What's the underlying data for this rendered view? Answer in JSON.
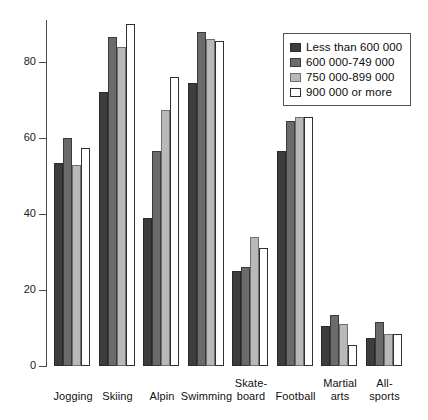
{
  "chart_data": {
    "type": "bar",
    "title": "",
    "xlabel": "",
    "ylabel": "",
    "ylim": [
      0,
      92
    ],
    "yticks": [
      0,
      20,
      40,
      60,
      80
    ],
    "ytick_labels": [
      "0",
      "20",
      "40",
      "60",
      "80"
    ],
    "grid": false,
    "legend_position": "top-right",
    "categories": [
      "Jogging",
      "Skiing",
      "Alpin",
      "Swimming",
      "Skate-\nboard",
      "Football",
      "Martial\narts",
      "All-sports"
    ],
    "series": [
      {
        "name": "Less than 600 000",
        "color": "#3d3d3d",
        "values": [
          53.5,
          72,
          39,
          74.5,
          25,
          56.5,
          10.5,
          7.5
        ]
      },
      {
        "name": "600 000-749 000",
        "color": "#6b6b6b",
        "values": [
          60,
          86.5,
          56.5,
          88,
          26,
          64.5,
          13.5,
          11.5
        ]
      },
      {
        "name": "750 000-899 000",
        "color": "#b9b9b9",
        "values": [
          53,
          84,
          67.5,
          86,
          34,
          65.5,
          11,
          8.5
        ]
      },
      {
        "name": "900 000 or more",
        "color": "#ffffff",
        "values": [
          57.5,
          90,
          76,
          85.5,
          31,
          65.5,
          5.5,
          8.5
        ]
      }
    ]
  },
  "legend": {
    "items": [
      {
        "label": "Less than 600 000"
      },
      {
        "label": "600 000-749 000"
      },
      {
        "label": "750 000-899 000"
      },
      {
        "label": "900 000 or more"
      }
    ]
  }
}
